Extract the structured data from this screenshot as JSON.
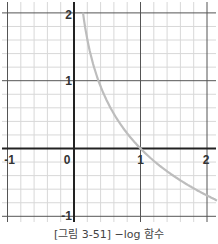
{
  "caption": "[그림 3-51] −log 함수",
  "colors": {
    "background": "#ffffff",
    "minor_grid": "#d8d8d8",
    "major_grid": "#555555",
    "axis": "#222222",
    "curve": "#bdbdbd",
    "tick_label": "#333333"
  },
  "chart_data": {
    "type": "line",
    "title": "",
    "caption": "[그림 3-51] −log 함수",
    "xlabel": "",
    "ylabel": "",
    "xlim": [
      -1,
      2
    ],
    "ylim": [
      -1,
      2
    ],
    "x_ticks": [
      -1,
      0,
      1,
      2
    ],
    "y_ticks": [
      -1,
      1,
      2
    ],
    "x_tick_labels": [
      "-1",
      "0",
      "1",
      "2"
    ],
    "y_tick_labels": [
      "-1",
      "1",
      "2"
    ],
    "grid": true,
    "minor_grid_step": 0.2,
    "legend": "none",
    "series": [
      {
        "name": "-log(x)",
        "function": "-ln(x)",
        "x": [
          0.135,
          0.15,
          0.2,
          0.25,
          0.3,
          0.4,
          0.5,
          0.6,
          0.7,
          0.8,
          0.9,
          1.0,
          1.2,
          1.4,
          1.6,
          1.8,
          2.0,
          2.1
        ],
        "y": [
          2.0,
          1.9,
          1.61,
          1.39,
          1.2,
          0.92,
          0.69,
          0.51,
          0.36,
          0.22,
          0.11,
          0.0,
          -0.18,
          -0.34,
          -0.47,
          -0.59,
          -0.69,
          -0.74
        ]
      }
    ]
  }
}
